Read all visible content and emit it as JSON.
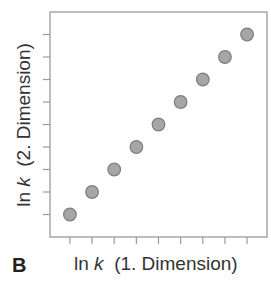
{
  "chart_data": {
    "type": "scatter",
    "title": "",
    "panel_label": "B",
    "xlabel": {
      "prefix": "ln ",
      "var": "k",
      "suffix": "  (1. Dimension)"
    },
    "ylabel": {
      "prefix": "ln ",
      "var": "k",
      "suffix": "  (2. Dimension)"
    },
    "x": [
      1,
      2,
      3,
      4,
      5,
      6,
      7,
      8,
      9
    ],
    "y": [
      1,
      2,
      3,
      4,
      5,
      6,
      7,
      8,
      9
    ],
    "xlim": [
      0.1,
      9.9
    ],
    "ylim": [
      0.0,
      10.0
    ],
    "x_ticks": [
      1,
      2,
      3,
      4,
      5,
      6,
      7,
      8,
      9
    ],
    "y_ticks": [
      1,
      2,
      3,
      4,
      5,
      6,
      7,
      8,
      9
    ],
    "tick_labels_shown": false,
    "grid": false,
    "legend": null,
    "marker_color": "#a6a6a6",
    "marker_edge_color": "#7d7d7d",
    "axis_color": "#9a9a9a"
  }
}
